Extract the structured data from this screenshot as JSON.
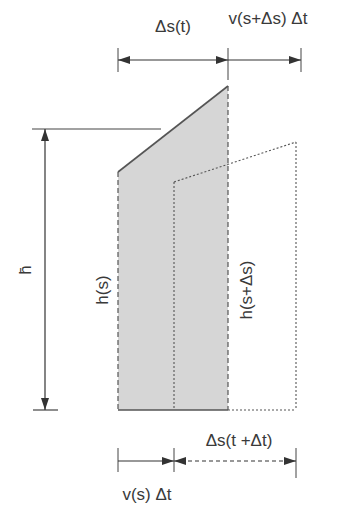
{
  "diagram": {
    "colors": {
      "fill": "#d6d6d6",
      "stroke": "#555555",
      "background": "#ffffff"
    },
    "labels": {
      "top_left": "Δs(t)",
      "top_right": "v(s+Δs) Δt",
      "h_bar": "h̄",
      "h_s": "h(s)",
      "h_s_plus": "h(s+Δs)",
      "bottom_right": "Δs(t +Δt)",
      "bottom_left": "v(s) Δt"
    },
    "elements": {
      "shaded_column": "column of height h(s) to h(s+Δs) over width Δs(t)",
      "shifted_column": "dotted outline shifted by v(s)Δt",
      "height_arrow": "double-headed vertical arrow for h̄",
      "top_dimension": "Δs(t) and v(s+Δs)Δt",
      "bottom_dimension": "v(s)Δt and Δs(t+Δt)"
    }
  }
}
